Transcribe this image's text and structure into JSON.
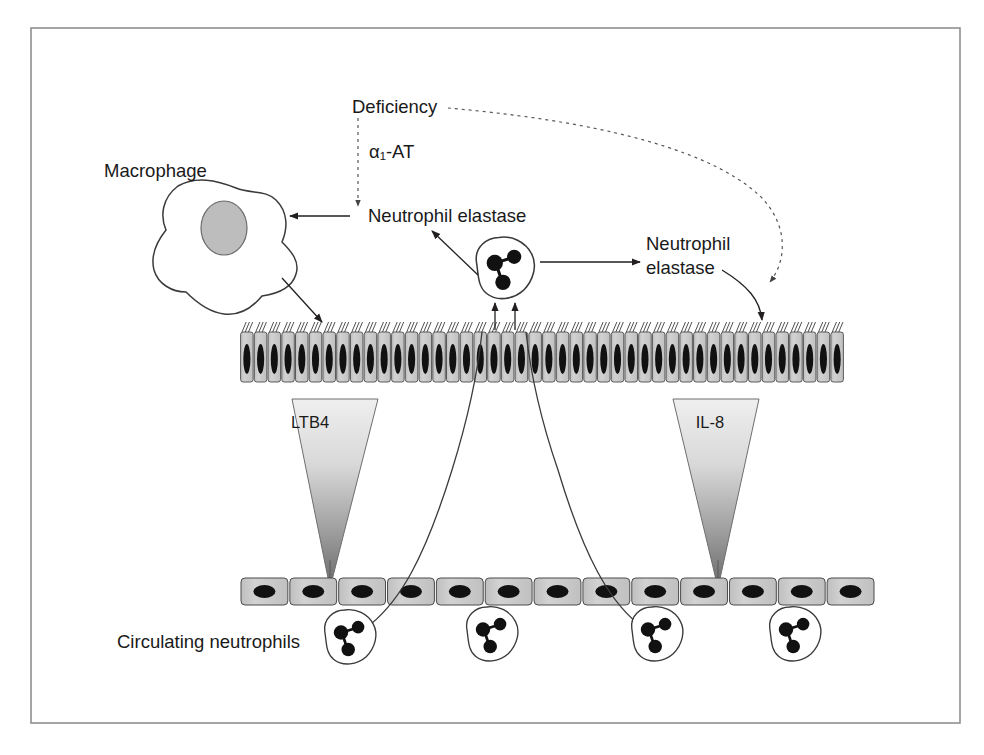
{
  "figure": {
    "border_color": "#8a8a8a",
    "background": "#ffffff"
  },
  "labels": {
    "deficiency": "Deficiency",
    "alpha1_at": "α₁-AT",
    "neutrophil_elastase_left": "Neutrophil elastase",
    "neutrophil_elastase_right_line1": "Neutrophil",
    "neutrophil_elastase_right_line2": "elastase",
    "macrophage": "Macrophage",
    "ltb4": "LTB4",
    "il8": "IL-8",
    "circulating_neutrophils": "Circulating neutrophils"
  },
  "colors": {
    "stroke": "#231f20",
    "epithelium_fill": "#c9c9c9",
    "epithelium_stroke": "#4a4a4a",
    "nucleus": "#111111",
    "macrophage_nucleus": "#bdbdbd",
    "gradient_top": "#ededed",
    "gradient_bottom": "#6e6e6e",
    "endothelium_fill": "#cdcdcd"
  },
  "structures": {
    "epithelium": {
      "name": "ciliated-columnar-epithelium",
      "x": 240,
      "y": 332,
      "width": 604,
      "cell_count": 44,
      "cell_height": 50,
      "cilia_per_cell": 3
    },
    "endothelium": {
      "name": "endothelium-vessel-wall",
      "x": 240,
      "y": 578,
      "width": 635,
      "cell_count": 13,
      "cell_height": 27
    },
    "macrophage": {
      "name": "macrophage-cell",
      "cx": 222,
      "cy": 248,
      "nucleus_rx": 23,
      "nucleus_ry": 27
    },
    "gradients": [
      {
        "name": "ltb4-gradient",
        "label_key": "ltb4",
        "apex_x": 329,
        "apex_y": 588,
        "top_y": 398,
        "top_left_x": 292,
        "top_right_x": 378
      },
      {
        "name": "il8-gradient",
        "label_key": "il8",
        "apex_x": 717,
        "apex_y": 588,
        "top_y": 398,
        "top_left_x": 673,
        "top_right_x": 758
      }
    ],
    "neutrophils": [
      {
        "name": "neutrophil-transmigrating",
        "cx": 505,
        "cy": 268,
        "scale": 1.0
      },
      {
        "name": "neutrophil-circulating-1",
        "cx": 350,
        "cy": 637,
        "scale": 0.92
      },
      {
        "name": "neutrophil-circulating-2",
        "cx": 492,
        "cy": 634,
        "scale": 0.92
      },
      {
        "name": "neutrophil-circulating-3",
        "cx": 657,
        "cy": 634,
        "scale": 0.92
      },
      {
        "name": "neutrophil-circulating-4",
        "cx": 795,
        "cy": 634,
        "scale": 0.92
      }
    ]
  },
  "arrows": [
    {
      "name": "arrow-alpha1at-inhibits-elastase",
      "style": "dashed",
      "from": "Deficiency",
      "to": "Neutrophil elastase"
    },
    {
      "name": "arrow-deficiency-to-lumen-elastase",
      "style": "dashed",
      "from": "Deficiency",
      "to": "Neutrophil elastase (right)"
    },
    {
      "name": "arrow-elastase-to-macrophage",
      "style": "solid",
      "from": "Neutrophil elastase",
      "to": "Macrophage"
    },
    {
      "name": "arrow-neutrophil-releases-elastase",
      "style": "solid",
      "from": "Neutrophil",
      "to": "Neutrophil elastase"
    },
    {
      "name": "arrow-neutrophil-to-right-elastase",
      "style": "solid",
      "from": "Neutrophil",
      "to": "Neutrophil elastase (right)"
    },
    {
      "name": "arrow-macrophage-to-epithelium",
      "style": "solid",
      "from": "Macrophage",
      "to": "Epithelium"
    },
    {
      "name": "arrow-right-elastase-to-epithelium",
      "style": "solid",
      "from": "Neutrophil elastase (right)",
      "to": "Epithelium"
    },
    {
      "name": "arrow-epithelium-to-neutrophil-a",
      "style": "solid",
      "from": "Epithelium",
      "to": "Neutrophil"
    },
    {
      "name": "arrow-epithelium-to-neutrophil-b",
      "style": "solid",
      "from": "Epithelium",
      "to": "Neutrophil"
    },
    {
      "name": "arrow-ltb4-chemotaxis",
      "style": "solid",
      "from": "LTB4 gradient",
      "to": "Endothelium"
    },
    {
      "name": "arrow-il8-chemotaxis",
      "style": "solid",
      "from": "IL-8 gradient",
      "to": "Endothelium"
    }
  ],
  "migration_paths": [
    {
      "name": "migration-path-left",
      "from": "neutrophil-circulating-1",
      "to": "epithelium"
    },
    {
      "name": "migration-path-right",
      "from": "neutrophil-circulating-3",
      "to": "epithelium"
    }
  ]
}
